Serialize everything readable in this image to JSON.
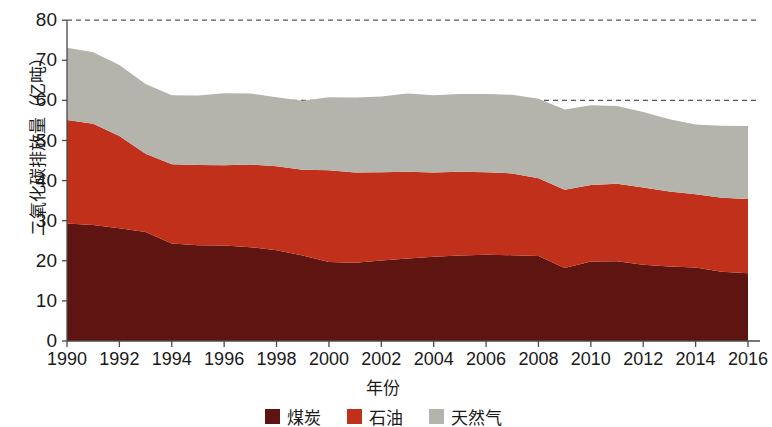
{
  "chart_data": {
    "type": "area",
    "stacked": true,
    "title": "",
    "xlabel": "年份",
    "ylabel": "二氧化碳排放量（亿吨）",
    "x": [
      1990,
      1991,
      1992,
      1993,
      1994,
      1995,
      1996,
      1997,
      1998,
      1999,
      2000,
      2001,
      2002,
      2003,
      2004,
      2005,
      2006,
      2007,
      2008,
      2009,
      2010,
      2011,
      2012,
      2013,
      2014,
      2015,
      2016
    ],
    "xtick_labels": [
      "1990",
      "1992",
      "1994",
      "1996",
      "1998",
      "2000",
      "2002",
      "2004",
      "2006",
      "2008",
      "2010",
      "2012",
      "2014",
      "2016"
    ],
    "xticks": [
      1990,
      1992,
      1994,
      1996,
      1998,
      2000,
      2002,
      2004,
      2006,
      2008,
      2010,
      2012,
      2014,
      2016
    ],
    "ytick_labels": [
      "0",
      "10",
      "20",
      "30",
      "40",
      "50",
      "60",
      "70",
      "80"
    ],
    "yticks": [
      0,
      10,
      20,
      30,
      40,
      50,
      60,
      70,
      80
    ],
    "xlim": [
      1990,
      2016
    ],
    "ylim": [
      0,
      80
    ],
    "grid": "horizontal-dashed-at-60-and-80",
    "legend_position": "bottom-center",
    "series": [
      {
        "name": "煤炭",
        "color": "#5e1410",
        "values": [
          29.3,
          28.9,
          28.1,
          27.2,
          24.3,
          23.9,
          23.8,
          23.4,
          22.6,
          21.3,
          19.7,
          19.5,
          20.1,
          20.6,
          21.0,
          21.3,
          21.5,
          21.4,
          21.2,
          18.2,
          19.8,
          19.9,
          19.0,
          18.6,
          18.3,
          17.3,
          16.9
        ]
      },
      {
        "name": "石油",
        "color": "#c0301a",
        "values": [
          25.8,
          25.3,
          23.0,
          19.5,
          19.8,
          20.0,
          20.0,
          20.6,
          21.0,
          21.4,
          22.9,
          22.5,
          22.0,
          21.6,
          21.0,
          20.9,
          20.6,
          20.4,
          19.4,
          19.5,
          19.1,
          19.3,
          19.3,
          18.7,
          18.3,
          18.4,
          18.5
        ]
      },
      {
        "name": "天然气",
        "color": "#b4b4ac",
        "values": [
          18.0,
          17.8,
          17.7,
          17.4,
          17.2,
          17.3,
          18.0,
          17.7,
          17.2,
          17.2,
          18.2,
          18.7,
          18.9,
          19.5,
          19.3,
          19.4,
          19.5,
          19.6,
          19.8,
          20.0,
          19.9,
          19.4,
          18.8,
          18.0,
          17.4,
          18.0,
          18.2
        ]
      }
    ],
    "colors": {
      "coal": "#5e1410",
      "oil": "#c0301a",
      "gas": "#b4b4ac",
      "axis": "#4a4a4a",
      "grid": "#555555",
      "text": "#1a1a1a",
      "background": "#ffffff"
    }
  },
  "legend": {
    "items": [
      {
        "label": "煤炭",
        "color": "#5e1410"
      },
      {
        "label": "石油",
        "color": "#c0301a"
      },
      {
        "label": "天然气",
        "color": "#b4b4ac"
      }
    ]
  }
}
